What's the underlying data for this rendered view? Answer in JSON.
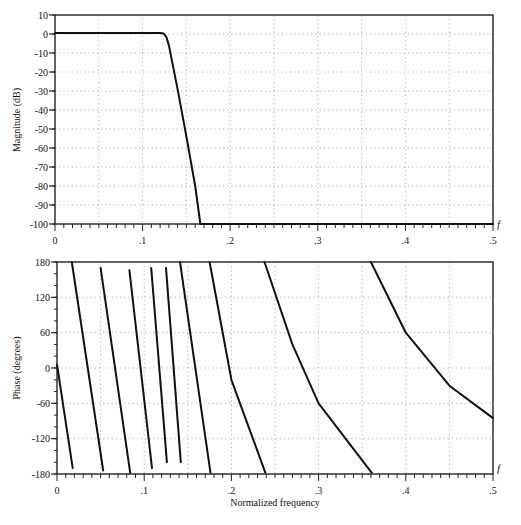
{
  "chart_data": [
    {
      "type": "line",
      "title": "",
      "xlabel": "f",
      "ylabel": "Magnitude (dB)",
      "xlim": [
        0,
        0.5
      ],
      "ylim": [
        -100,
        10
      ],
      "x_ticks": [
        "0",
        ".1",
        ".2",
        ".3",
        ".4",
        ".5"
      ],
      "y_ticks": [
        "10",
        "0",
        "-10",
        "-20",
        "-30",
        "-40",
        "-50",
        "-60",
        "-70",
        "-80",
        "-90",
        "-100"
      ],
      "grid": true,
      "series": [
        {
          "name": "magnitude",
          "x": [
            0,
            0.05,
            0.1,
            0.12,
            0.124,
            0.127,
            0.13,
            0.14,
            0.15,
            0.16,
            0.166,
            0.2,
            0.3,
            0.4,
            0.5
          ],
          "y": [
            0.5,
            0.5,
            0.5,
            0.5,
            0.2,
            -1.5,
            -6,
            -29,
            -54,
            -80,
            -100,
            -100,
            -100,
            -100,
            -100
          ]
        }
      ]
    },
    {
      "type": "line",
      "title": "",
      "xlabel": "Normalized frequency",
      "ylabel": "Phase (degrees)",
      "xlim": [
        0,
        0.5
      ],
      "ylim": [
        -180,
        180
      ],
      "x_ticks": [
        "0",
        ".1",
        ".2",
        ".3",
        ".4",
        ".5"
      ],
      "y_ticks": [
        "180",
        "120",
        "60",
        "0",
        "-60",
        "-120",
        "-180"
      ],
      "grid": true,
      "series": [
        {
          "name": "phase-seg-1",
          "x": [
            0.0,
            0.018
          ],
          "y": [
            6,
            -170
          ]
        },
        {
          "name": "phase-seg-2",
          "x": [
            0.017,
            0.053
          ],
          "y": [
            180,
            -174
          ]
        },
        {
          "name": "phase-seg-3",
          "x": [
            0.05,
            0.084
          ],
          "y": [
            170,
            -178
          ]
        },
        {
          "name": "phase-seg-4",
          "x": [
            0.083,
            0.109
          ],
          "y": [
            166,
            -170
          ]
        },
        {
          "name": "phase-seg-5",
          "x": [
            0.108,
            0.126
          ],
          "y": [
            170,
            -160
          ]
        },
        {
          "name": "phase-seg-6",
          "x": [
            0.125,
            0.142
          ],
          "y": [
            170,
            -160
          ]
        },
        {
          "name": "phase-seg-7",
          "x": [
            0.141,
            0.176
          ],
          "y": [
            180,
            -178
          ]
        },
        {
          "name": "phase-seg-8",
          "x": [
            0.175,
            0.2,
            0.239
          ],
          "y": [
            180,
            -20,
            -178
          ]
        },
        {
          "name": "phase-seg-9",
          "x": [
            0.238,
            0.27,
            0.3,
            0.361
          ],
          "y": [
            180,
            40,
            -60,
            -178
          ]
        },
        {
          "name": "phase-seg-10",
          "x": [
            0.36,
            0.4,
            0.45,
            0.5
          ],
          "y": [
            180,
            60,
            -30,
            -85
          ]
        }
      ]
    }
  ],
  "labels": {
    "mag_ylabel": "Magnitude (dB)",
    "phase_ylabel": "Phase (degrees)",
    "xlabel": "Normalized frequency",
    "f_symbol": "f"
  }
}
